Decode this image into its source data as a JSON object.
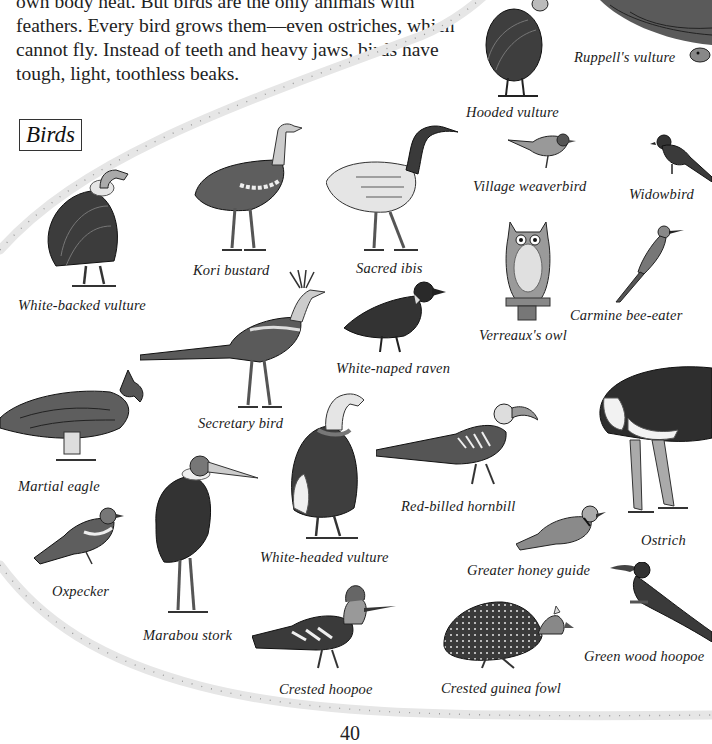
{
  "intro": {
    "lines": [
      "own body heat. But birds are the only animals with",
      "feathers. Every bird grows them—even ostriches, which",
      "cannot fly. Instead of teeth and heavy jaws, birds have",
      "tough, light, toothless beaks."
    ]
  },
  "section": {
    "heading": "Birds"
  },
  "birds": [
    {
      "id": "ruppells-vulture",
      "label": "Ruppell's vulture"
    },
    {
      "id": "hooded-vulture",
      "label": "Hooded vulture"
    },
    {
      "id": "village-weaverbird",
      "label": "Village weaverbird"
    },
    {
      "id": "widowbird",
      "label": "Widowbird"
    },
    {
      "id": "white-backed-vulture",
      "label": "White-backed vulture"
    },
    {
      "id": "kori-bustard",
      "label": "Kori bustard"
    },
    {
      "id": "sacred-ibis",
      "label": "Sacred ibis"
    },
    {
      "id": "verreauxs-owl",
      "label": "Verreaux's owl"
    },
    {
      "id": "carmine-bee-eater",
      "label": "Carmine bee-eater"
    },
    {
      "id": "white-naped-raven",
      "label": "White-naped raven"
    },
    {
      "id": "secretary-bird",
      "label": "Secretary bird"
    },
    {
      "id": "martial-eagle",
      "label": "Martial eagle"
    },
    {
      "id": "red-billed-hornbill",
      "label": "Red-billed hornbill"
    },
    {
      "id": "ostrich",
      "label": "Ostrich"
    },
    {
      "id": "white-headed-vulture",
      "label": "White-headed vulture"
    },
    {
      "id": "oxpecker",
      "label": "Oxpecker"
    },
    {
      "id": "greater-honey-guide",
      "label": "Greater honey guide"
    },
    {
      "id": "marabou-stork",
      "label": "Marabou stork"
    },
    {
      "id": "green-wood-hoopoe",
      "label": "Green wood hoopoe"
    },
    {
      "id": "crested-hoopoe",
      "label": "Crested hoopoe"
    },
    {
      "id": "crested-guinea-fowl",
      "label": "Crested guinea fowl"
    }
  ],
  "footer": {
    "page_number": "40"
  },
  "colors": {
    "ink": "#1a1a1a",
    "feather_dark": "#3a3a3a",
    "feather_mid": "#6e6e6e",
    "feather_light": "#bdbdbd",
    "border_dots": "#c8c8c8"
  }
}
